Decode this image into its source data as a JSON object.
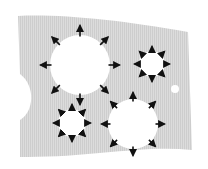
{
  "diagram": {
    "title": "",
    "background": "#ffffff",
    "sheet": {
      "fill": "#d9d9d9",
      "stripe": "#cfcfcf",
      "path": "M18,16 C60,14 120,20 188,32 L192,150 C140,145 90,158 20,157 L20,120 C34,112 36,86 20,74 Z"
    },
    "holes": [
      {
        "id": "large-top-left",
        "cx": 80,
        "cy": 65,
        "r": 30,
        "arrows": 8,
        "arrow_len": 11,
        "arrow_offset": 34,
        "color": "#111111",
        "style": "expand"
      },
      {
        "id": "small-top-right",
        "cx": 152,
        "cy": 64,
        "r": 13,
        "arrows": 8,
        "arrow_len": 5,
        "arrow_offset": 15,
        "color": "#111111",
        "style": "expand"
      },
      {
        "id": "small-bottom-left",
        "cx": 72,
        "cy": 123,
        "r": 14,
        "arrows": 8,
        "arrow_len": 5,
        "arrow_offset": 16,
        "color": "#111111",
        "style": "expand"
      },
      {
        "id": "large-bottom-right",
        "cx": 133,
        "cy": 124,
        "r": 25,
        "arrows": 8,
        "arrow_len": 9,
        "arrow_offset": 27,
        "color": "#111111",
        "style": "expand"
      },
      {
        "id": "dot",
        "cx": 175,
        "cy": 89,
        "r": 4,
        "arrows": 0
      }
    ]
  }
}
